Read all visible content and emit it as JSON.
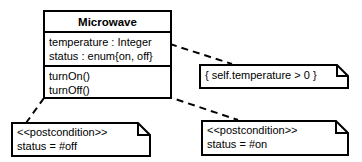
{
  "diagram": {
    "type": "uml-class-diagram",
    "line_color": "#000000",
    "background_color": "#ffffff"
  },
  "class_box": {
    "name": "Microwave",
    "attributes": [
      "temperature : Integer",
      "status : enum{on, off}"
    ],
    "operations": [
      "turnOn()",
      "turnOff()"
    ]
  },
  "notes": {
    "constraint": {
      "text": "{ self.temperature > 0 }"
    },
    "postcondition_off": {
      "stereotype": "<<postcondition>>",
      "body": "status = #off"
    },
    "postcondition_on": {
      "stereotype": "<<postcondition>>",
      "body": "status = #on"
    }
  },
  "connectors": [
    {
      "name": "attributes-to-constraint",
      "style": "dashed"
    },
    {
      "name": "turnoff-to-postcondition-off",
      "style": "dashed"
    },
    {
      "name": "turnon-to-postcondition-on",
      "style": "dashed"
    }
  ]
}
